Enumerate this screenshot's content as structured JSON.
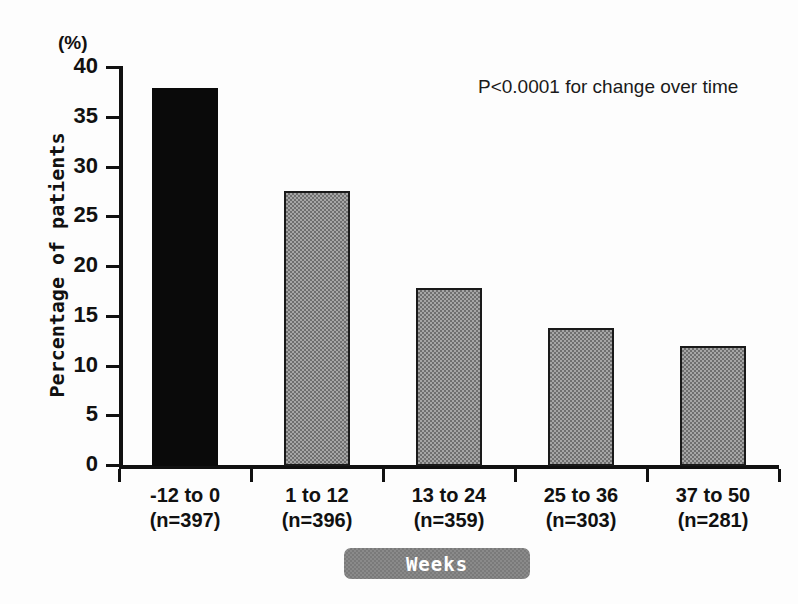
{
  "chart_data": {
    "type": "bar",
    "title": "",
    "subtitle": "",
    "unit_label": "(%)",
    "xlabel": "Weeks",
    "ylabel": "Percentage of patients",
    "categories": [
      "-12 to 0",
      "1 to 12",
      "13 to 24",
      "25 to 36",
      "37 to 50"
    ],
    "category_sublabels": [
      "(n=397)",
      "(n=396)",
      "(n=359)",
      "(n=303)",
      "(n=281)"
    ],
    "values": [
      38.0,
      27.6,
      17.9,
      13.9,
      12.1
    ],
    "ylim": [
      0,
      40
    ],
    "yticks": [
      0,
      5,
      10,
      15,
      20,
      25,
      30,
      35,
      40
    ],
    "ytick_labels": [
      "0",
      "5",
      "10",
      "15",
      "20",
      "25",
      "30",
      "35",
      "40"
    ],
    "grid": false,
    "legend": "none",
    "annotations": [
      "P<0.0001 for change over time"
    ],
    "bar_styles": [
      "solid-black",
      "hatched-gray",
      "hatched-gray",
      "hatched-gray",
      "hatched-gray"
    ],
    "colors": {
      "bar_solid": "#0a0a0a",
      "bar_hatched": "#a6a6a6",
      "axis": "#111111",
      "badge_background": "#8a8a8a",
      "badge_text": "#ffffff"
    }
  },
  "annotation": {
    "p_value_text": "P<0.0001 for change over time"
  },
  "axes": {
    "unit": "(%)",
    "y_title": "Percentage of patients",
    "x_title": "Weeks"
  }
}
